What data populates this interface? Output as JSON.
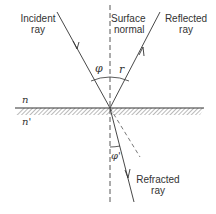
{
  "diagram": {
    "labels": {
      "incident_ray": [
        "Incident",
        "ray"
      ],
      "surface_normal": [
        "Surface",
        "normal"
      ],
      "reflected_ray": [
        "Reflected",
        "ray"
      ],
      "refracted_ray": [
        "Refracted",
        "ray"
      ]
    },
    "symbols": {
      "angle_incidence": "φ",
      "angle_reflection": "r",
      "angle_refraction": "φ'",
      "index_upper": "n",
      "index_lower": "n'"
    },
    "colors": {
      "line": "#333333",
      "hatch": "#999999",
      "background": "#ffffff"
    }
  }
}
